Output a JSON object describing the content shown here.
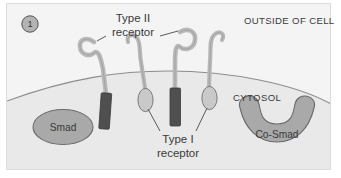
{
  "figure": {
    "panel_number": "1",
    "background_color": "#f2f2f2",
    "frame_border_color": "#d8d8d8",
    "membrane_line_color": "#8d8d8d",
    "cytosol_fill_color": "#e9e9e9",
    "outside_fill_color": "#f4f4f4",
    "leader_line_color": "#4a4a4a"
  },
  "regions": {
    "outside_label": "OUTSIDE OF CELL",
    "cytosol_label": "CYTOSOL"
  },
  "annotations": {
    "type_ii_line1": "Type II",
    "type_ii_line2": "receptor",
    "type_i_line1": "Type I",
    "type_i_line2": "receptor"
  },
  "proteins": [
    {
      "name": "smad",
      "label": "Smad",
      "shape": "ellipse",
      "fill": "#a9a9a9",
      "stroke": "#6a6a6a"
    },
    {
      "name": "co-smad",
      "label": "Co-Smad",
      "shape": "crescent",
      "fill": "#a9a9a9",
      "stroke": "#6a6a6a"
    }
  ],
  "receptors": [
    {
      "name": "type-ii-receptor-left",
      "kind": "Type II",
      "tm_shape": "rectangle",
      "tm_fill": "#4f4f4f",
      "stalk_fill": "#c3c3c3"
    },
    {
      "name": "type-i-receptor-left",
      "kind": "Type I",
      "tm_shape": "ellipse",
      "tm_fill": "#c9c9c9",
      "stalk_fill": "#c3c3c3"
    },
    {
      "name": "type-ii-receptor-right",
      "kind": "Type II",
      "tm_shape": "rectangle",
      "tm_fill": "#4f4f4f",
      "stalk_fill": "#c3c3c3"
    },
    {
      "name": "type-i-receptor-right",
      "kind": "Type I",
      "tm_shape": "ellipse",
      "tm_fill": "#c9c9c9",
      "stalk_fill": "#c3c3c3"
    }
  ]
}
